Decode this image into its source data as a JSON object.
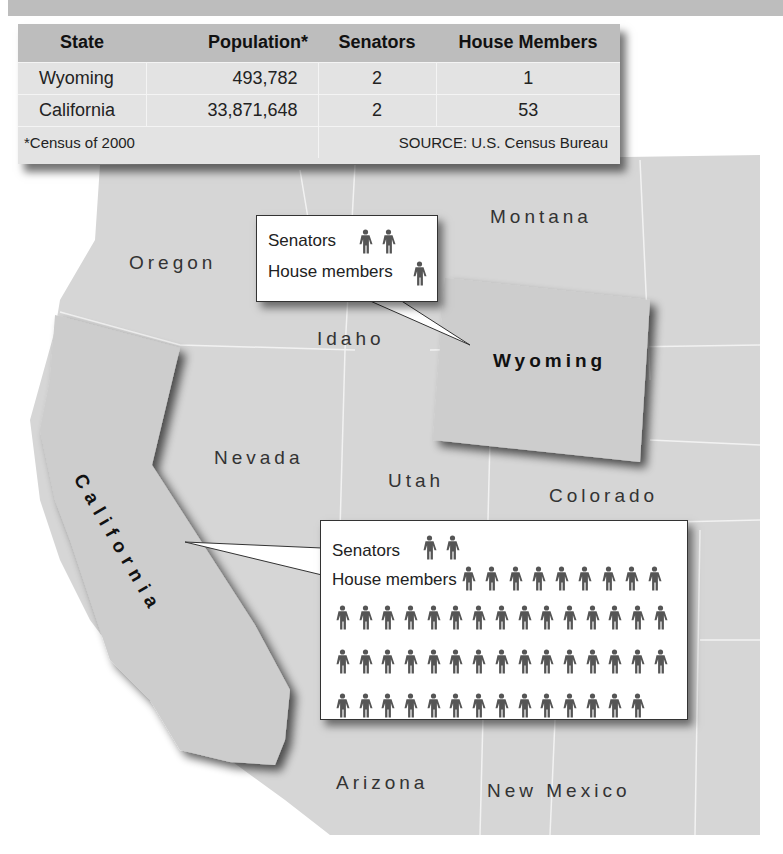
{
  "table": {
    "headers": [
      "State",
      "Population*",
      "Senators",
      "House Members"
    ],
    "rows": [
      {
        "state": "Wyoming",
        "population": "493,782",
        "senators": "2",
        "house": "1"
      },
      {
        "state": "California",
        "population": "33,871,648",
        "senators": "2",
        "house": "53"
      }
    ],
    "footnote": "*Census of 2000",
    "source": "SOURCE: U.S. Census Bureau"
  },
  "map": {
    "labels": {
      "montana": "Montana",
      "oregon": "Oregon",
      "idaho": "Idaho",
      "wyoming": "Wyoming",
      "nevada": "Nevada",
      "utah": "Utah",
      "colorado": "Colorado",
      "california": "California",
      "arizona": "Arizona",
      "new_mexico": "New Mexico"
    }
  },
  "callouts": {
    "wyoming": {
      "senators_label": "Senators",
      "house_label": "House members",
      "senators_count": 2,
      "house_count": 1
    },
    "california": {
      "senators_label": "Senators",
      "house_label": "House members",
      "senators_count": 2,
      "house_count": 53
    }
  },
  "colors": {
    "map_fill": "#d6d6d6",
    "highlight_fill": "#cdcdcd",
    "table_header": "#bdbdbd",
    "table_body": "#e3e3e3",
    "person_icon": "#555555"
  },
  "chart_data": {
    "type": "table",
    "columns": [
      "State",
      "Population*",
      "Senators",
      "House Members"
    ],
    "rows": [
      [
        "Wyoming",
        493782,
        2,
        1
      ],
      [
        "California",
        33871648,
        2,
        53
      ]
    ],
    "pictograph": {
      "unit": "1 person icon = 1 member of Congress",
      "series": [
        {
          "name": "Wyoming",
          "senators": 2,
          "house_members": 1
        },
        {
          "name": "California",
          "senators": 2,
          "house_members": 53
        }
      ]
    },
    "annotations": [
      "*Census of 2000",
      "SOURCE: U.S. Census Bureau"
    ]
  }
}
